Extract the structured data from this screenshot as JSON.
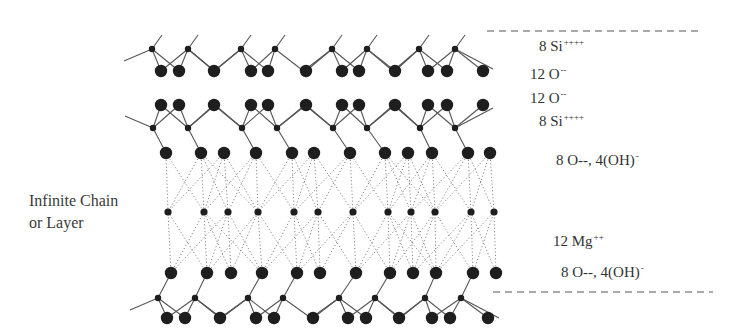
{
  "diagram": {
    "side_label": {
      "line1": "Infinite Chain",
      "line2": "or Layer"
    },
    "layer_labels": [
      {
        "id": "si-top",
        "base": "8 Si",
        "sup": "++++",
        "x": 539,
        "y": 38
      },
      {
        "id": "o-top",
        "base": "12 O",
        "sup": "--",
        "x": 530,
        "y": 66
      },
      {
        "id": "o-upper",
        "base": "12 O",
        "sup": "--",
        "x": 530,
        "y": 90
      },
      {
        "id": "si-upper",
        "base": "8 Si",
        "sup": "++++",
        "x": 539,
        "y": 113
      },
      {
        "id": "oh-upper",
        "base": "8 O--, 4(OH)",
        "sup": "-",
        "x": 556,
        "y": 152
      },
      {
        "id": "mg",
        "base": "12 Mg",
        "sup": "++",
        "x": 553,
        "y": 233
      },
      {
        "id": "oh-lower",
        "base": "8 O--, 4(OH)",
        "sup": "-",
        "x": 561,
        "y": 264
      }
    ],
    "boundaries": [
      {
        "x1": 487,
        "x2": 700,
        "y": 31
      },
      {
        "x1": 493,
        "x2": 713,
        "y": 292
      }
    ],
    "colors": {
      "atom": "#1e1e1e",
      "bond": "#555555",
      "dotted": "#8a8a8a",
      "dash": "#555555"
    },
    "rows": {
      "si_top": {
        "y": 49,
        "r": 3.2,
        "x": [
          152,
          188,
          241,
          275,
          332,
          367,
          419,
          455
        ]
      },
      "o_top": {
        "y": 71,
        "r": 6.2,
        "x": [
          161,
          179,
          214,
          251,
          268,
          306,
          342,
          359,
          395,
          428,
          447,
          483
        ]
      },
      "o_upper": {
        "y": 105,
        "r": 6.2,
        "x": [
          161,
          179,
          214,
          251,
          268,
          306,
          342,
          359,
          395,
          428,
          447,
          483
        ]
      },
      "si_upper": {
        "y": 128,
        "r": 3.2,
        "x": [
          153,
          188,
          242,
          277,
          333,
          367,
          420,
          455
        ]
      },
      "oh_upper": {
        "y": 153,
        "r": 6.2,
        "x": [
          166,
          201,
          224,
          256,
          292,
          314,
          350,
          385,
          408,
          432,
          468,
          490
        ]
      },
      "mg": {
        "y": 212,
        "r": 3.6,
        "x": [
          168,
          204,
          228,
          258,
          294,
          318,
          353,
          388,
          411,
          435,
          471,
          494
        ]
      },
      "oh_lower": {
        "y": 273,
        "r": 6.2,
        "x": [
          171,
          207,
          231,
          262,
          297,
          320,
          356,
          390,
          413,
          436,
          473,
          496
        ]
      },
      "si_bottom": {
        "y": 298,
        "r": 3.2,
        "x": [
          158,
          195,
          248,
          283,
          339,
          375,
          425,
          461
        ]
      },
      "o_bottom": {
        "y": 318,
        "r": 6.2,
        "x": [
          167,
          185,
          220,
          256,
          274,
          313,
          348,
          366,
          399,
          432,
          450,
          488
        ]
      }
    }
  }
}
